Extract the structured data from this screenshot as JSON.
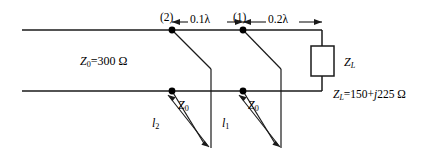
{
  "figure": {
    "type": "double-stub-transmission-line-circuit",
    "line_color": "#1a1a1a",
    "text_color": "#000000",
    "background": "#ffffff"
  },
  "labels": {
    "node_2": "(2)",
    "node_1": "(1)",
    "dim_stub2_to_stub1": "0.1λ",
    "dim_stub1_to_load": "0.2λ",
    "main_line_impedance_prefix": "Z",
    "main_line_impedance_sub": "0",
    "main_line_impedance_value": "=300 Ω",
    "load_box_prefix": "Z",
    "load_box_sub": "L",
    "load_value_prefix": "Z",
    "load_value_sub": "L",
    "load_value_eq": "=150+",
    "load_value_j": "j",
    "load_value_rest": "225 Ω",
    "stub2_impedance_prefix": "Z",
    "stub2_impedance_sub": "0",
    "stub1_impedance_prefix": "Z",
    "stub1_impedance_sub": "0",
    "stub2_length_prefix": "l",
    "stub2_length_sub": "2",
    "stub1_length_prefix": "l",
    "stub1_length_sub": "1"
  },
  "geometry": {
    "top_conductor_y": 30,
    "bottom_conductor_y": 91,
    "line_left_x": 22,
    "line_right_x": 322,
    "node2_x": 172,
    "node1_x": 243,
    "dim_line_y": 22
  }
}
